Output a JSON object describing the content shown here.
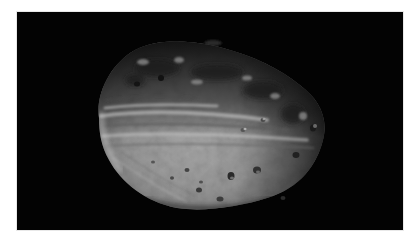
{
  "image": {
    "subject": "asteroid",
    "description": "Grayscale photograph of a cratered, oblong asteroid against a black space background",
    "colors": {
      "background": "#030303",
      "border": "#ffffff",
      "surface_light": "#b9b9b9",
      "surface_mid": "#8c8c8c",
      "surface_dark": "#3a3a3a"
    }
  }
}
